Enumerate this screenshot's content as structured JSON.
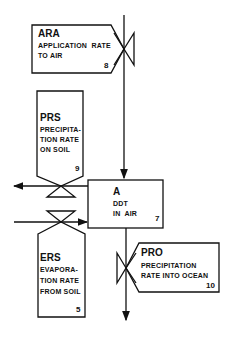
{
  "diagram": {
    "nodes": {
      "ara": {
        "code": "ARA",
        "line1": "APPLICATION  RATE",
        "line2": "TO AIR",
        "number": "8"
      },
      "prs": {
        "code": "PRS",
        "line1": "PRECIPITA-",
        "line2": "TION RATE",
        "line3": "ON SOIL",
        "number": "9"
      },
      "a": {
        "code": "A",
        "line1": "DDT",
        "line2": "IN  AIR",
        "number": "7"
      },
      "ers": {
        "code": "ERS",
        "line1": "EVAPORA-",
        "line2": "TION RATE",
        "line3": "FROM SOIL",
        "number": "5"
      },
      "pro": {
        "code": "PRO",
        "line1": "PRECIPITATION",
        "line2": "RATE INTO OCEAN",
        "number": "10"
      }
    },
    "colors": {
      "stroke": "#111111",
      "background": "#ffffff"
    }
  }
}
